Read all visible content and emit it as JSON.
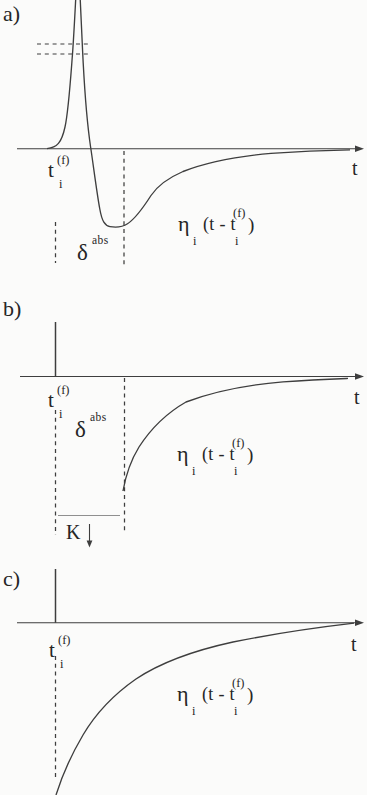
{
  "figure": {
    "colors": {
      "background": "#fbfbfa",
      "line": "#3e3e3e",
      "text": "#262626",
      "faint_line": "#8f8f8f"
    },
    "panels": [
      {
        "tag": "a)",
        "axis_label": "t",
        "spike_time": {
          "base": "t",
          "sup": "(f)",
          "sub": "i"
        },
        "abs_refractory": {
          "base": "δ",
          "sup": "abs"
        },
        "kernel": {
          "base": "η",
          "base_sub": "i",
          "arg_open": "(t - t",
          "arg_sup": "(f)",
          "arg_sub": "i",
          "arg_close": ")"
        }
      },
      {
        "tag": "b)",
        "axis_label": "t",
        "spike_time": {
          "base": "t",
          "sup": "(f)",
          "sub": "i"
        },
        "abs_refractory": {
          "base": "δ",
          "sup": "abs"
        },
        "reset_label": "K",
        "kernel": {
          "base": "η",
          "base_sub": "i",
          "arg_open": "(t - t",
          "arg_sup": "(f)",
          "arg_sub": "i",
          "arg_close": ")"
        }
      },
      {
        "tag": "c)",
        "axis_label": "t",
        "spike_time": {
          "base": "t",
          "sup": "(f)",
          "sub": "i"
        },
        "kernel": {
          "base": "η",
          "base_sub": "i",
          "arg_open": "(t - t",
          "arg_sup": "(f)",
          "arg_sub": "i",
          "arg_close": ")"
        }
      }
    ]
  }
}
